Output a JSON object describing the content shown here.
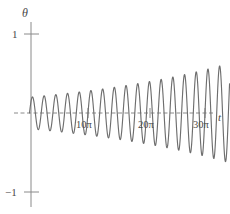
{
  "chart_data": {
    "type": "line",
    "title": "",
    "xlabel": "t",
    "ylabel": "θ",
    "xlim": [
      -1.0,
      34.5
    ],
    "ylim": [
      -1.15,
      1.15
    ],
    "grid": false,
    "legend": "none",
    "x_unit": "pi",
    "x_ticks": [
      10,
      20,
      30
    ],
    "x_tick_labels": [
      "10π",
      "20π",
      "30π"
    ],
    "y_ticks": [
      1,
      -1
    ],
    "y_tick_labels": [
      "1",
      "−1"
    ],
    "zero_line": "dashed",
    "series": [
      {
        "name": "theta(t)",
        "description": "growing-amplitude oscillation",
        "color": "#6e6e6e",
        "amplitude_start": 0.2,
        "amplitude_end": 0.63,
        "period_pi": 2,
        "t_start_pi": 0,
        "t_end_pi": 34.2,
        "phase": 0,
        "points": [
          [
            0.0,
            0.0
          ],
          [
            0.5,
            0.2
          ],
          [
            1.0,
            0.0
          ],
          [
            1.5,
            -0.203
          ],
          [
            2.0,
            0.0
          ],
          [
            2.5,
            0.207
          ],
          [
            3.0,
            0.0
          ],
          [
            3.5,
            -0.21
          ],
          [
            4.0,
            0.0
          ],
          [
            4.5,
            0.214
          ],
          [
            5.0,
            0.0
          ],
          [
            5.5,
            -0.218
          ],
          [
            6.0,
            0.0
          ],
          [
            6.5,
            0.222
          ],
          [
            7.0,
            0.0
          ],
          [
            7.5,
            -0.226
          ],
          [
            8.0,
            0.0
          ],
          [
            8.5,
            0.231
          ],
          [
            9.0,
            0.0
          ],
          [
            9.5,
            -0.236
          ],
          [
            10.0,
            0.0
          ],
          [
            10.5,
            0.241
          ],
          [
            11.0,
            0.0
          ],
          [
            11.5,
            -0.247
          ],
          [
            12.0,
            0.0
          ],
          [
            12.5,
            0.253
          ],
          [
            13.0,
            0.0
          ],
          [
            13.5,
            -0.259
          ],
          [
            14.0,
            0.0
          ],
          [
            14.5,
            0.266
          ],
          [
            15.0,
            0.0
          ],
          [
            15.5,
            -0.274
          ],
          [
            16.0,
            0.0
          ],
          [
            16.5,
            0.282
          ],
          [
            17.0,
            0.0
          ],
          [
            17.5,
            -0.291
          ],
          [
            18.0,
            0.0
          ],
          [
            18.5,
            0.3
          ],
          [
            19.0,
            0.0
          ],
          [
            19.5,
            -0.311
          ],
          [
            20.0,
            0.0
          ],
          [
            20.5,
            0.322
          ],
          [
            21.0,
            0.0
          ],
          [
            21.5,
            -0.335
          ],
          [
            22.0,
            0.0
          ],
          [
            22.5,
            0.349
          ],
          [
            23.0,
            0.0
          ],
          [
            23.5,
            -0.364
          ],
          [
            24.0,
            0.0
          ],
          [
            24.5,
            0.381
          ],
          [
            25.0,
            0.0
          ],
          [
            25.5,
            -0.4
          ],
          [
            26.0,
            0.0
          ],
          [
            26.5,
            0.421
          ],
          [
            27.0,
            0.0
          ],
          [
            27.5,
            -0.445
          ],
          [
            28.0,
            0.0
          ],
          [
            28.5,
            0.472
          ],
          [
            29.0,
            0.0
          ],
          [
            29.5,
            -0.503
          ],
          [
            30.0,
            0.0
          ],
          [
            30.5,
            0.538
          ],
          [
            31.0,
            0.0
          ],
          [
            31.5,
            -0.578
          ],
          [
            32.0,
            0.0
          ],
          [
            32.5,
            0.62
          ],
          [
            33.0,
            0.0
          ],
          [
            33.5,
            -0.63
          ],
          [
            34.0,
            0.0
          ]
        ]
      }
    ]
  },
  "axes": {
    "y_axis_label": "θ",
    "x_axis_label": "t",
    "y_top_tick": "1",
    "y_bottom_tick": "−1",
    "x_tick_1": "10π",
    "x_tick_2": "20π",
    "x_tick_3": "30π"
  },
  "colors": {
    "curve": "#6e6e6e",
    "axis": "#8a8a8a",
    "text": "#4a4a4a",
    "background": "#ffffff"
  }
}
